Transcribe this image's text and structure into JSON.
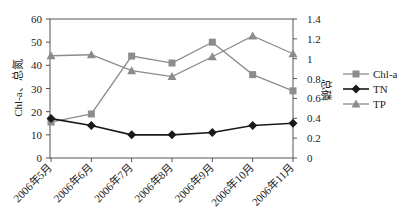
{
  "chart_data": {
    "type": "line",
    "title": "",
    "categories": [
      "2006年5月",
      "2006年6月",
      "2006年7月",
      "2006年8月",
      "2006年9月",
      "2006年10月",
      "2006年11月"
    ],
    "xlabel": "",
    "ylabel": "Chl-a、总氮",
    "y2label": "总磷",
    "ylim": [
      0,
      60
    ],
    "y2lim": [
      0,
      1.4
    ],
    "yticks": [
      0,
      10,
      20,
      30,
      40,
      50,
      60
    ],
    "y2ticks": [
      "0",
      "0.2",
      "0.4",
      "0.6",
      "0.8",
      "1",
      "1.2",
      "1.4"
    ],
    "grid": false,
    "legend_position": "right",
    "series": [
      {
        "name": "Chl-a",
        "axis": "left",
        "marker": "square",
        "color": "#8c8c8c",
        "values": [
          15.5,
          19,
          44,
          41,
          50,
          36,
          29
        ]
      },
      {
        "name": "TN",
        "axis": "left",
        "marker": "diamond",
        "color": "#1a1a1a",
        "values": [
          17,
          14,
          10,
          10,
          11,
          14,
          15
        ]
      },
      {
        "name": "TP",
        "axis": "right",
        "marker": "triangle",
        "color": "#8c8c8c",
        "values": [
          1.03,
          1.04,
          0.88,
          0.82,
          1.02,
          1.23,
          1.05
        ]
      }
    ]
  }
}
